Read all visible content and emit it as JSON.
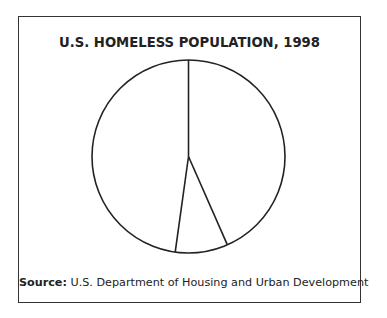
{
  "chart_data": {
    "type": "pie",
    "title": "U.S. HOMELESS POPULATION, 1998",
    "source_label": "Source:",
    "source_text": "U.S. Department of Housing and Urban Development",
    "labels": [
      "Slice A (right)",
      "Slice B (bottom)",
      "Slice C (left)"
    ],
    "values": [
      43.4,
      8.8,
      47.8
    ],
    "unlabeled": true,
    "start_angle_deg": 0,
    "direction": "clockwise",
    "fill": "none",
    "stroke_color": "#222222",
    "legend": "none"
  },
  "frame": {
    "border_color": "#333333",
    "background": "#ffffff"
  }
}
